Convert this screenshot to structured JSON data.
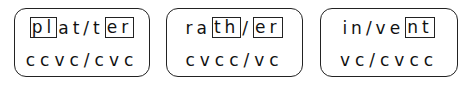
{
  "cards": [
    {
      "word_segments": [
        {
          "text": "pl",
          "boxed": true
        },
        {
          "text": "at/t",
          "boxed": false
        },
        {
          "text": "er",
          "boxed": true
        }
      ],
      "pattern": "ccvc/cvc"
    },
    {
      "word_segments": [
        {
          "text": "ra",
          "boxed": false
        },
        {
          "text": "th",
          "boxed": true
        },
        {
          "text": "/",
          "boxed": false
        },
        {
          "text": "er",
          "boxed": true
        }
      ],
      "pattern": "cvcc/vc"
    },
    {
      "word_segments": [
        {
          "text": "in/ve",
          "boxed": false
        },
        {
          "text": "nt",
          "boxed": true
        }
      ],
      "pattern": "vc/cvcc"
    }
  ]
}
